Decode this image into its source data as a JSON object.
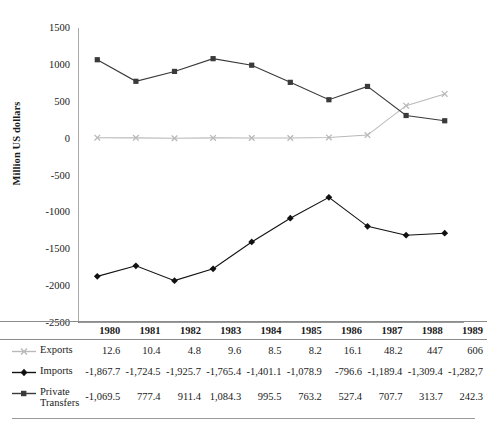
{
  "axis": {
    "ylabel": "Million US dollars",
    "yticks": [
      1500,
      1000,
      500,
      0,
      -500,
      -1000,
      -1500,
      -2000,
      -2500
    ],
    "ytick_labels": [
      "1500",
      "1000",
      "500",
      "0",
      "-500",
      "-1000",
      "-1500",
      "-2000",
      "-2500"
    ]
  },
  "colors": {
    "exports": "#b9b9b9",
    "imports": "#111111",
    "private_transfers": "#3a3a3a",
    "rule": "#8a8a8a",
    "axis": "#7a7a7a",
    "text": "#1a1a1a"
  },
  "table": {
    "row_header_col": "",
    "years": [
      "1980",
      "1981",
      "1982",
      "1983",
      "1984",
      "1985",
      "1986",
      "1987",
      "1988",
      "1989"
    ],
    "rows": [
      {
        "label": "Exports",
        "marker": "x-marker-icon",
        "values": [
          "12.6",
          "10.4",
          "4.8",
          "9.6",
          "8.5",
          "8.2",
          "16.1",
          "48.2",
          "447",
          "606"
        ]
      },
      {
        "label": "Imports",
        "marker": "diamond-marker-icon",
        "values": [
          "-1,867.7",
          "-1,724.5",
          "-1,925.7",
          "-1,765.4",
          "-1,401.1",
          "-1,078.9",
          "-796.6",
          "-1,189.4",
          "-1,309.4",
          "-1,282,7"
        ]
      },
      {
        "label": "Private Transfers",
        "marker": "square-marker-icon",
        "values": [
          "-1,069.5",
          "777.4",
          "911.4",
          "1,084.3",
          "995.5",
          "763.2",
          "527.4",
          "707.7",
          "313.7",
          "242.3"
        ]
      }
    ]
  },
  "chart_data": {
    "type": "line",
    "title": "",
    "xlabel": "",
    "ylabel": "Million US dollars",
    "categories": [
      "1980",
      "1981",
      "1982",
      "1983",
      "1984",
      "1985",
      "1986",
      "1987",
      "1988",
      "1989"
    ],
    "ylim": [
      -2500,
      1500
    ],
    "ytick_step": 500,
    "grid": false,
    "legend_position": "table-row-headers",
    "series": [
      {
        "name": "Exports",
        "color": "#b9b9b9",
        "marker": "x",
        "values": [
          12.6,
          10.4,
          4.8,
          9.6,
          8.5,
          8.2,
          16.1,
          48.2,
          447,
          606
        ]
      },
      {
        "name": "Imports",
        "color": "#111111",
        "marker": "diamond",
        "values": [
          -1867.7,
          -1724.5,
          -1925.7,
          -1765.4,
          -1401.1,
          -1078.9,
          -796.6,
          -1189.4,
          -1309.4,
          -1282.7
        ]
      },
      {
        "name": "Private Transfers",
        "color": "#3a3a3a",
        "marker": "square",
        "values": [
          1069.5,
          777.4,
          911.4,
          1084.3,
          995.5,
          763.2,
          527.4,
          707.7,
          313.7,
          242.3
        ]
      }
    ]
  }
}
